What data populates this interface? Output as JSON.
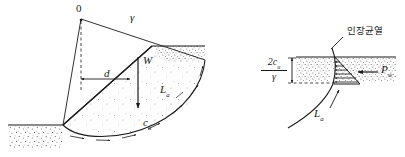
{
  "figure": {
    "width": 405,
    "height": 157,
    "background": "#ffffff",
    "line_color": "#1a1a1a",
    "stipple_color": "#4a4a4a"
  },
  "left_diagram": {
    "name": "circular-slip-surface-diagram",
    "labels": {
      "center_point": "0",
      "radius": "γ",
      "moment_arm": "d",
      "weight": "W",
      "arc_length": "L",
      "arc_length_sub": "a",
      "undrained_cohesion": "c",
      "undrained_cohesion_sub": "u"
    }
  },
  "right_diagram": {
    "name": "tension-crack-detail",
    "labels": {
      "tension_crack": "인장균열",
      "crack_depth_numerator": "2c",
      "crack_depth_numerator_sub": "u",
      "crack_depth_denominator": "γ",
      "water_force": "P",
      "water_force_sub": "w",
      "arc_length": "L",
      "arc_length_sub": "a"
    }
  }
}
